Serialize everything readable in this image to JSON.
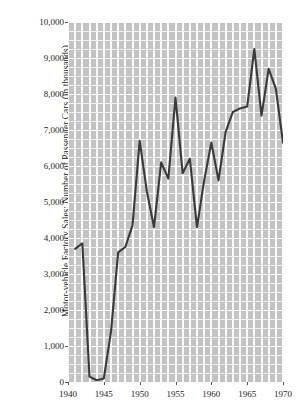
{
  "chart_data": {
    "type": "line",
    "title": "",
    "xlabel": "",
    "ylabel": "Motor-vehicle Factory Sales: Number of Passenger Cars (in thousands)",
    "xlim": [
      1940,
      1970
    ],
    "ylim": [
      0,
      10000
    ],
    "grid": true,
    "legend": false,
    "line_color": "#3a3a3a",
    "panel_color": "#c3c3c3",
    "gridline_color": "#ffffff",
    "ytick_labels": [
      "10,000",
      "9,000",
      "8,000",
      "7,000",
      "6,000",
      "5,000",
      "4,000",
      "3,000",
      "2,000",
      "1,000",
      "0"
    ],
    "ytick_values": [
      10000,
      9000,
      8000,
      7000,
      6000,
      5000,
      4000,
      3000,
      2000,
      1000,
      0
    ],
    "xtick_labels": [
      "1940",
      "1945",
      "1950",
      "1955",
      "1960",
      "1965",
      "1970"
    ],
    "xtick_values": [
      1940,
      1945,
      1950,
      1955,
      1960,
      1965,
      1970
    ],
    "x": [
      1941,
      1942,
      1943,
      1944,
      1945,
      1946,
      1947,
      1948,
      1949,
      1950,
      1951,
      1952,
      1953,
      1954,
      1955,
      1956,
      1957,
      1958,
      1959,
      1960,
      1961,
      1962,
      1963,
      1964,
      1965,
      1966,
      1967,
      1968,
      1969,
      1970
    ],
    "values": [
      3700,
      3850,
      150,
      50,
      100,
      1400,
      3600,
      3750,
      4350,
      6700,
      5300,
      4300,
      6100,
      5650,
      7900,
      5800,
      6200,
      4300,
      5600,
      6650,
      5600,
      6950,
      7500,
      7600,
      7650,
      9250,
      7400,
      8700,
      8150,
      6650
    ],
    "series": [
      {
        "name": "Passenger cars",
        "values": [
          3700,
          3850,
          150,
          50,
          100,
          1400,
          3600,
          3750,
          4350,
          6700,
          5300,
          4300,
          6100,
          5650,
          7900,
          5800,
          6200,
          4300,
          5600,
          6650,
          5600,
          6950,
          7500,
          7600,
          7650,
          9250,
          7400,
          8700,
          8150,
          6650
        ]
      }
    ]
  }
}
